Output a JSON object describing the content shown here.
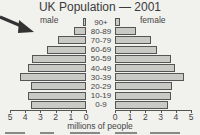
{
  "chart_data": {
    "type": "bar",
    "subtype": "population-pyramid",
    "title": "UK Population — 2001",
    "xlabel": "millions of people",
    "ylabel": "",
    "categories": [
      "90+",
      "80-89",
      "70-79",
      "60-69",
      "50-59",
      "40-49",
      "30-39",
      "20-29",
      "10-19",
      "0-9"
    ],
    "series": [
      {
        "name": "male",
        "values": [
          0.2,
          0.8,
          1.9,
          2.6,
          3.6,
          3.9,
          4.4,
          3.7,
          3.9,
          3.7
        ]
      },
      {
        "name": "female",
        "values": [
          0.3,
          1.4,
          2.4,
          2.8,
          3.7,
          4.0,
          4.6,
          3.8,
          3.7,
          3.5
        ]
      }
    ],
    "xlim": [
      0,
      5
    ],
    "x_ticks_left": [
      "5",
      "4",
      "3",
      "2",
      "1",
      "0"
    ],
    "x_ticks_right": [
      "0",
      "1",
      "2",
      "3",
      "4",
      "5"
    ],
    "grid": false,
    "legend": {
      "left": "male",
      "right": "female"
    }
  },
  "labels": {
    "title": "UK Population — 2001",
    "male": "male",
    "female": "female",
    "xlabel": "millions of people"
  },
  "colors": {
    "bar_fill": "#c9c9c6",
    "bar_border": "#555555",
    "background": "#f1f1ee",
    "arrow": "#333333"
  }
}
